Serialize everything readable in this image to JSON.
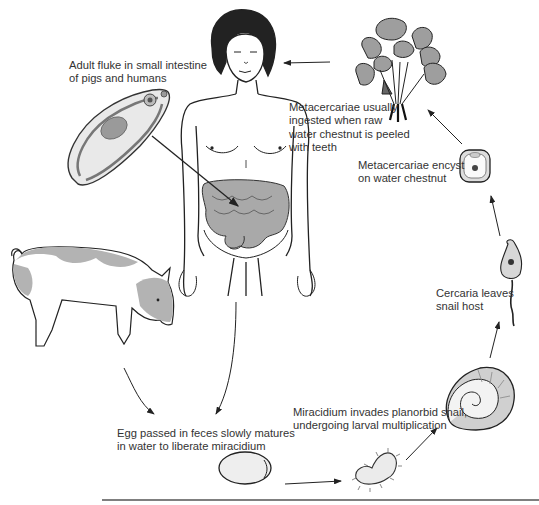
{
  "diagram": {
    "colors": {
      "line": "#222222",
      "shade": "#9a9a9a",
      "light_shade": "#cfcfcf",
      "background": "#ffffff"
    },
    "labels": {
      "adult": [
        "Adult fluke in small intestine",
        "of pigs and humans"
      ],
      "ingested": [
        "Metacercariae usually",
        "ingested when raw",
        "water chestnut is peeled",
        "with teeth"
      ],
      "encyst": [
        "Metacercariae encyst",
        "on water chestnut"
      ],
      "cercaria": [
        "Cercaria leaves",
        "snail host"
      ],
      "miracidium": [
        "Miracidium invades planorbid snail,",
        "undergoing larval multiplication"
      ],
      "egg": [
        "Egg passed in feces slowly matures",
        "in water to liberate miracidium"
      ]
    },
    "stages": [
      {
        "id": "adult-fluke",
        "name": "Adult fluke"
      },
      {
        "id": "human-host",
        "name": "Human (definitive host)"
      },
      {
        "id": "pig-host",
        "name": "Pig (reservoir host)"
      },
      {
        "id": "egg",
        "name": "Egg"
      },
      {
        "id": "miracidium",
        "name": "Miracidium"
      },
      {
        "id": "snail",
        "name": "Planorbid snail"
      },
      {
        "id": "cercaria",
        "name": "Cercaria"
      },
      {
        "id": "metacercaria-cyst",
        "name": "Metacercaria cyst"
      },
      {
        "id": "water-chestnut",
        "name": "Water chestnut plant"
      }
    ]
  }
}
